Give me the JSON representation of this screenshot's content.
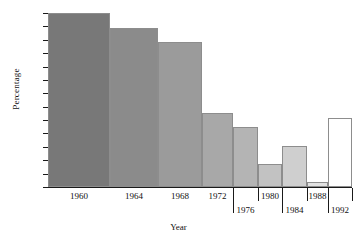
{
  "chart_data": {
    "type": "bar",
    "title": "",
    "xlabel": "Year",
    "ylabel": "Percentage",
    "categories": [
      "1960",
      "1964",
      "1968",
      "1972",
      "1976",
      "1980",
      "1984",
      "1988",
      "1992"
    ],
    "values": [
      63.0,
      61.9,
      60.85,
      55.5,
      54.5,
      51.7,
      53.05,
      50.4,
      55.15
    ],
    "ylim": [
      50,
      63
    ],
    "ytick_labels": [
      "63",
      "62",
      "61",
      "60",
      "59",
      "58",
      "57",
      "56",
      "55",
      "54",
      "53",
      "52",
      "51",
      "50"
    ],
    "ytick_values": [
      63,
      62,
      61,
      60,
      59,
      58,
      57,
      56,
      55,
      54,
      53,
      52,
      51,
      50
    ],
    "grid": false,
    "legend": "none",
    "bar_colors": [
      "#787878",
      "#8b8b8b",
      "#9b9b9b",
      "#a8a8a8",
      "#b4b4b4",
      "#c2c2c2",
      "#cfcfcf",
      "#e2e2e2",
      "#ffffff"
    ],
    "bar_edge_color": "#8d8d8d",
    "axis_color": "#1a1a1a",
    "background": "#ffffff",
    "label_rows": [
      0,
      0,
      0,
      0,
      1,
      0,
      1,
      0,
      1
    ]
  }
}
